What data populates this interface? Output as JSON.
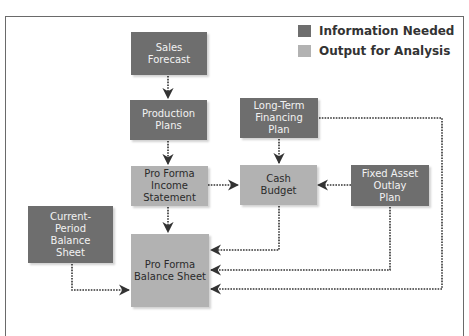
{
  "legend": {
    "items": [
      {
        "label": "Information Needed",
        "color": "#6e6e6e"
      },
      {
        "label": "Output for Analysis",
        "color": "#b2b2b2"
      }
    ]
  },
  "nodes": {
    "sales_forecast": {
      "label": "Sales\nForecast",
      "type": "Information Needed"
    },
    "production_plans": {
      "label": "Production\nPlans",
      "type": "Information Needed"
    },
    "long_term_financing_plan": {
      "label": "Long-Term\nFinancing\nPlan",
      "type": "Information Needed"
    },
    "pro_forma_income_statement": {
      "label": "Pro Forma\nIncome\nStatement",
      "type": "Output for Analysis"
    },
    "cash_budget": {
      "label": "Cash\nBudget",
      "type": "Output for Analysis"
    },
    "fixed_asset_outlay_plan": {
      "label": "Fixed Asset\nOutlay\nPlan",
      "type": "Information Needed"
    },
    "current_period_balance_sheet": {
      "label": "Current-\nPeriod\nBalance\nSheet",
      "type": "Information Needed"
    },
    "pro_forma_balance_sheet": {
      "label": "Pro Forma\nBalance Sheet",
      "type": "Output for Analysis"
    }
  },
  "edges": [
    {
      "from": "Sales Forecast",
      "to": "Production Plans"
    },
    {
      "from": "Production Plans",
      "to": "Pro Forma Income Statement"
    },
    {
      "from": "Long-Term Financing Plan",
      "to": "Cash Budget"
    },
    {
      "from": "Long-Term Financing Plan",
      "to": "Pro Forma Balance Sheet"
    },
    {
      "from": "Pro Forma Income Statement",
      "to": "Cash Budget"
    },
    {
      "from": "Pro Forma Income Statement",
      "to": "Pro Forma Balance Sheet"
    },
    {
      "from": "Fixed Asset Outlay Plan",
      "to": "Cash Budget"
    },
    {
      "from": "Fixed Asset Outlay Plan",
      "to": "Pro Forma Balance Sheet"
    },
    {
      "from": "Cash Budget",
      "to": "Pro Forma Balance Sheet"
    },
    {
      "from": "Current-Period Balance Sheet",
      "to": "Pro Forma Balance Sheet"
    }
  ]
}
